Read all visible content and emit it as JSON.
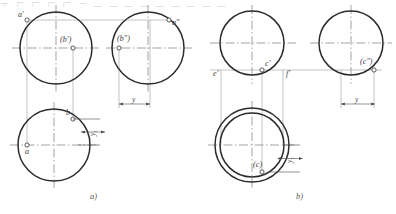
{
  "figure": {
    "background_color": "#ffffff",
    "outline_color": "#2b2b2b",
    "thin_line_color": "#8c8c8c",
    "center_line_color": "#777777",
    "label_color": "#3a3a3a"
  },
  "top_artifact": {
    "text": "工 厂 厂 厂 厂 二 一 一 一 一 一 一 一 一 一"
  },
  "panel_a": {
    "caption": "a)",
    "front_view": {
      "name": "front-view-circle",
      "cx": 56,
      "cy": 48,
      "r": 36,
      "points": [
        {
          "id": "a-prime",
          "label": "a′",
          "x": 27,
          "y": 20,
          "visible": true,
          "label_dx": -9,
          "label_dy": -9
        },
        {
          "id": "b-prime",
          "label": "(b′)",
          "x": 73,
          "y": 48,
          "visible": false,
          "label_dx": -13,
          "label_dy": -12
        }
      ]
    },
    "side_view": {
      "name": "side-view-circle",
      "cx": 148,
      "cy": 48,
      "r": 36,
      "points": [
        {
          "id": "a-double-prime",
          "label": "a″",
          "x": 169,
          "y": 20,
          "visible": true,
          "label_dx": 3,
          "label_dy": -1
        },
        {
          "id": "b-double-prime",
          "label": "(b″)",
          "x": 119,
          "y": 48,
          "visible": false,
          "label_dx": -2,
          "label_dy": -13
        }
      ]
    },
    "top_view": {
      "name": "top-view-circle",
      "cx": 54,
      "cy": 145,
      "r": 36,
      "points": [
        {
          "id": "a-point",
          "label": "a",
          "x": 27,
          "y": 145,
          "visible": true,
          "label_dx": -2,
          "label_dy": 3
        },
        {
          "id": "b-point",
          "label": "b",
          "x": 73,
          "y": 119,
          "visible": true,
          "label_dx": -7,
          "label_dy": -10
        }
      ]
    },
    "dimensions": [
      {
        "id": "y1",
        "label": "y₁",
        "orientation": "vertical",
        "x": 93,
        "y_from": 119,
        "y_to": 145
      },
      {
        "id": "y",
        "label": "y",
        "orientation": "horizontal",
        "y": 104,
        "x_from": 119,
        "x_to": 150
      }
    ]
  },
  "panel_b": {
    "caption": "b)",
    "front_view": {
      "name": "front-view-circle",
      "cx": 252,
      "cy": 43,
      "r": 32,
      "points": [
        {
          "id": "c-prime",
          "label": "c′",
          "x": 262,
          "y": 70,
          "visible": true,
          "label_dx": 2,
          "label_dy": -10
        },
        {
          "id": "e-prime",
          "label": "e′",
          "x": 221,
          "y": 70,
          "visible": true,
          "label_dx": -7,
          "label_dy": 1
        },
        {
          "id": "f-prime",
          "label": "f′",
          "x": 283,
          "y": 70,
          "visible": true,
          "label_dx": 3,
          "label_dy": 1
        }
      ]
    },
    "side_view": {
      "name": "side-view-circle",
      "cx": 351,
      "cy": 43,
      "r": 32,
      "points": [
        {
          "id": "c-double-prime",
          "label": "(c″)",
          "x": 374,
          "y": 70,
          "visible": false,
          "label_dx": -12,
          "label_dy": -12
        }
      ]
    },
    "top_view": {
      "name": "top-view-annulus",
      "cx": 252,
      "cy": 145,
      "r_outer": 37,
      "r_inner": 32,
      "points": [
        {
          "id": "c-point",
          "label": "(c)",
          "x": 262,
          "y": 172,
          "visible": false,
          "label_dx": -7,
          "label_dy": -11
        }
      ]
    },
    "dimensions": [
      {
        "id": "y1",
        "label": "y₁",
        "orientation": "vertical",
        "x": 290,
        "y_from": 145,
        "y_to": 172
      },
      {
        "id": "y",
        "label": "y",
        "orientation": "horizontal",
        "y": 104,
        "x_from": 341,
        "x_to": 375
      }
    ]
  }
}
